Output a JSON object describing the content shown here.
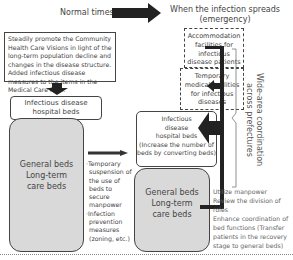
{
  "header": {
    "normal_times": "Normal times",
    "emergency_line1": "When the infection spreads",
    "emergency_line2": "(emergency)"
  },
  "left": {
    "policy_box": "Steadily promote the Community Health Care Visions in light of the long-term population decline and changes in the disease structure. Added infectious disease measures to the items in the Medical Care Plan.",
    "infectious_beds": "Infectious disease hospital beds",
    "general_beds_line1": "General beds",
    "general_beds_line2": "Long-term",
    "general_beds_line3": "care beds"
  },
  "middle_notes": {
    "lines": [
      "·Temporary",
      "suspension of",
      "the use of",
      "beds to secure",
      "manpower",
      "·Infection",
      "prevention",
      "measures",
      "(zoning, etc.)"
    ]
  },
  "right": {
    "accommodation": "Accommodation facilities for infectious disease patients",
    "temporary": "Temporary medical facilities for infectious diseases",
    "infectious_beds_lines": [
      "Infectious",
      "disease",
      "hospital beds",
      "(Increase the number of",
      "beds by converting beds)"
    ],
    "general_beds_line1": "General beds",
    "general_beds_line2": "Long-term",
    "general_beds_line3": "care beds"
  },
  "bottom_notes": {
    "lines": [
      "Utilize manpower",
      "Review the division of roles",
      "Enhance coordination of",
      "bed functions (Transfer",
      "patients in the recovery",
      "stage to general beds)"
    ]
  },
  "side_label": {
    "line1": "Wide-area coordination",
    "line2": "across prefectures"
  },
  "colors": {
    "arrow": "#222222",
    "gray_fill": "#d9d9d9",
    "border": "#444444",
    "text": "#444444"
  }
}
